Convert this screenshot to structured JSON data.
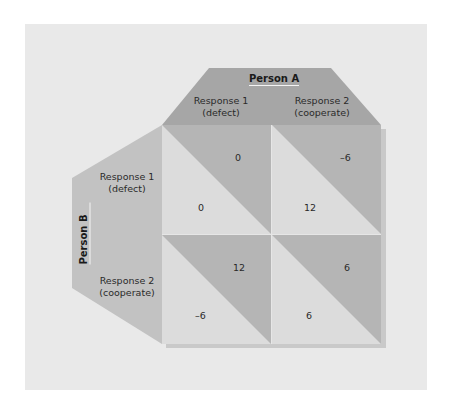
{
  "colors": {
    "background": "#e9e9e9",
    "header_a": "#a6a6a6",
    "header_b": "#c2c2c2",
    "cell_dark": "#b5b5b5",
    "cell_light": "#dcdcdc",
    "shadow": "#c9c9c9"
  },
  "person_a": {
    "title": "Person A",
    "responses": [
      {
        "line1": "Response 1",
        "line2": "(defect)"
      },
      {
        "line1": "Response 2",
        "line2": "(cooperate)"
      }
    ]
  },
  "person_b": {
    "title": "Person B",
    "responses": [
      {
        "line1": "Response 1",
        "line2": "(defect)"
      },
      {
        "line1": "Response 2",
        "line2": "(cooperate)"
      }
    ]
  },
  "matrix": {
    "cells": [
      {
        "row": "B Response 1 (defect)",
        "col": "A Response 1 (defect)",
        "payoff_a": "0",
        "payoff_b": "0"
      },
      {
        "row": "B Response 1 (defect)",
        "col": "A Response 2 (cooperate)",
        "payoff_a": "–6",
        "payoff_b": "12"
      },
      {
        "row": "B Response 2 (cooperate)",
        "col": "A Response 1 (defect)",
        "payoff_a": "12",
        "payoff_b": "–6"
      },
      {
        "row": "B Response 2 (cooperate)",
        "col": "A Response 2 (cooperate)",
        "payoff_a": "6",
        "payoff_b": "6"
      }
    ]
  }
}
